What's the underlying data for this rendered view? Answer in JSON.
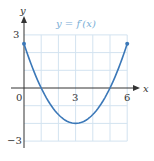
{
  "chart_data": {
    "type": "line",
    "title": "y = f′(x)",
    "xlabel": "x",
    "ylabel": "y",
    "xlim": [
      0,
      6
    ],
    "ylim": [
      -3,
      3
    ],
    "x_ticks": [
      "0",
      "3",
      "6"
    ],
    "y_ticks": [
      "3",
      "−3"
    ],
    "grid": true,
    "grid_step": 1,
    "series": [
      {
        "name": "f′(x)",
        "formula": "0.5*(x-3)^2 - 2",
        "x": [
          0,
          1,
          2,
          3,
          4,
          5,
          6
        ],
        "values": [
          2.5,
          0,
          -1.5,
          -2,
          -1.5,
          0,
          2.5
        ],
        "endpoints_marked": true
      }
    ],
    "colors": {
      "curve": "#3b78b8",
      "grid": "#c9dcec",
      "axis": "#333333",
      "title": "#7aaed6"
    }
  },
  "labels": {
    "title": "y = f′(x)",
    "x_axis": "x",
    "y_axis": "y",
    "x0": "0",
    "x3": "3",
    "x6": "6",
    "y3": "3",
    "ym3": "−3"
  }
}
